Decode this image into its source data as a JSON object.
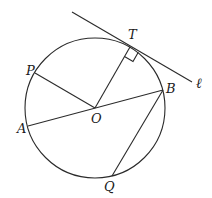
{
  "diagram": {
    "type": "circle-geometry",
    "circle": {
      "center_label": "O",
      "cx": 95,
      "cy": 108,
      "r": 70
    },
    "points": {
      "T": {
        "label": "T",
        "x": 130,
        "y": 47,
        "lx": 128,
        "ly": 39
      },
      "P": {
        "label": "P",
        "x": 35,
        "y": 73,
        "lx": 26,
        "ly": 75
      },
      "A": {
        "label": "A",
        "x": 28,
        "y": 126,
        "lx": 17,
        "ly": 133
      },
      "O": {
        "label": "O",
        "x": 95,
        "y": 108,
        "lx": 91,
        "ly": 123
      },
      "B": {
        "label": "B",
        "x": 163,
        "y": 90,
        "lx": 166,
        "ly": 93
      },
      "Q": {
        "label": "Q",
        "x": 112,
        "y": 176,
        "lx": 104,
        "ly": 191
      }
    },
    "tangent_line": {
      "label": "ℓ",
      "x1": 72,
      "y1": 12,
      "x2": 192,
      "y2": 82,
      "lx": 196,
      "ly": 88
    },
    "segments": [
      "OT",
      "OP",
      "AB",
      "BQ"
    ],
    "right_angle_marker": "at T between OT and tangent ℓ"
  }
}
